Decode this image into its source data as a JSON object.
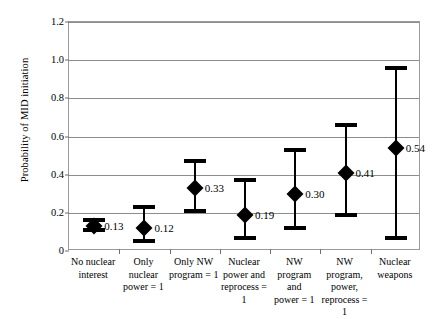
{
  "chart_data": {
    "type": "scatter",
    "title": "",
    "xlabel": "",
    "ylabel": "Probability of MID initiation",
    "ylim": [
      0,
      1.2
    ],
    "yticks": [
      0,
      0.2,
      0.4,
      0.6,
      0.8,
      1.0,
      1.2
    ],
    "ytick_labels": [
      "0",
      "0.2",
      "0.4",
      "0.6",
      "0.8",
      "1.0",
      "1.2"
    ],
    "grid": true,
    "legend": "none",
    "categories": [
      "No nuclear\ninterest",
      "Only\nnuclear\npower = 1",
      "Only NW\nprogram = 1",
      "Nuclear\npower and\nreprocess = 1",
      "NW\nprogram and\npower = 1",
      "NW\nprogram,\npower,\nreprocess = 1",
      "Nuclear\nweapons"
    ],
    "values": [
      0.13,
      0.12,
      0.33,
      0.19,
      0.3,
      0.41,
      0.54
    ],
    "value_labels": [
      "0.13",
      "0.12",
      "0.33",
      "0.19",
      "0.30",
      "0.41",
      "0.54"
    ],
    "ci_low": [
      0.11,
      0.05,
      0.21,
      0.07,
      0.12,
      0.19,
      0.07
    ],
    "ci_high": [
      0.16,
      0.23,
      0.47,
      0.37,
      0.53,
      0.66,
      0.96
    ],
    "marker": "diamond",
    "marker_color": "#000000",
    "error_bar_color": "#000000",
    "gridline_color": "#8d8d8d",
    "frame_color": "#9a9a9a",
    "background": "#ffffff"
  }
}
